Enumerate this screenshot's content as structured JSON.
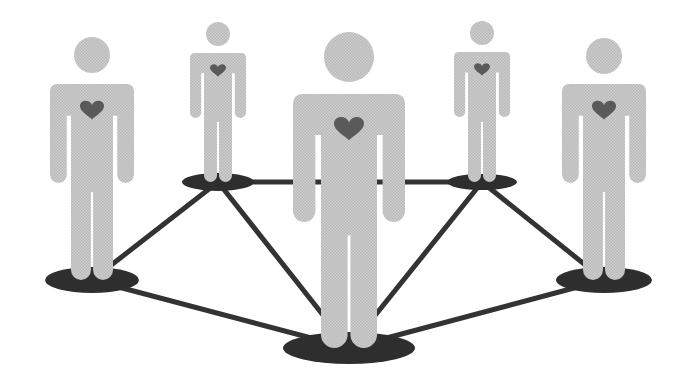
{
  "illustration": {
    "subject": "social network of people connected by links",
    "colors": {
      "background": "#ffffff",
      "person_fill": "#c4c4c4",
      "heart_fill": "#5a5a5a",
      "node_base_fill": "#2e2e2e",
      "link_stroke": "#333333"
    },
    "people": [
      {
        "id": "person-left",
        "cx": 92,
        "head_cy": 55,
        "head_r": 18,
        "body_top": 84,
        "body_w": 84,
        "arm_end": 183,
        "body_bottom": 190,
        "foot_y": 280,
        "heart_y": 108,
        "heart_s": 12,
        "base_rx": 47,
        "base_ry": 13
      },
      {
        "id": "person-back-left",
        "cx": 218,
        "head_cy": 34,
        "head_r": 12,
        "body_top": 53,
        "body_w": 56,
        "arm_end": 118,
        "body_bottom": 120,
        "foot_y": 182,
        "heart_y": 69,
        "heart_s": 8,
        "base_rx": 36,
        "base_ry": 9
      },
      {
        "id": "person-center",
        "cx": 349,
        "head_cy": 57,
        "head_r": 25,
        "body_top": 94,
        "body_w": 112,
        "arm_end": 222,
        "body_bottom": 230,
        "foot_y": 348,
        "heart_y": 126,
        "heart_s": 15,
        "base_rx": 66,
        "base_ry": 16
      },
      {
        "id": "person-back-right",
        "cx": 482,
        "head_cy": 33,
        "head_r": 12,
        "body_top": 52,
        "body_w": 56,
        "arm_end": 117,
        "body_bottom": 120,
        "foot_y": 182,
        "heart_y": 68,
        "heart_s": 8,
        "base_rx": 35,
        "base_ry": 8
      },
      {
        "id": "person-right",
        "cx": 604,
        "head_cy": 56,
        "head_r": 18,
        "body_top": 84,
        "body_w": 84,
        "arm_end": 183,
        "body_bottom": 190,
        "foot_y": 280,
        "heart_y": 108,
        "heart_s": 12,
        "base_rx": 48,
        "base_ry": 13
      }
    ],
    "links": [
      {
        "from": 0,
        "to": 1
      },
      {
        "from": 0,
        "to": 2
      },
      {
        "from": 1,
        "to": 2
      },
      {
        "from": 1,
        "to": 3
      },
      {
        "from": 2,
        "to": 3
      },
      {
        "from": 2,
        "to": 4
      },
      {
        "from": 3,
        "to": 4
      }
    ]
  }
}
